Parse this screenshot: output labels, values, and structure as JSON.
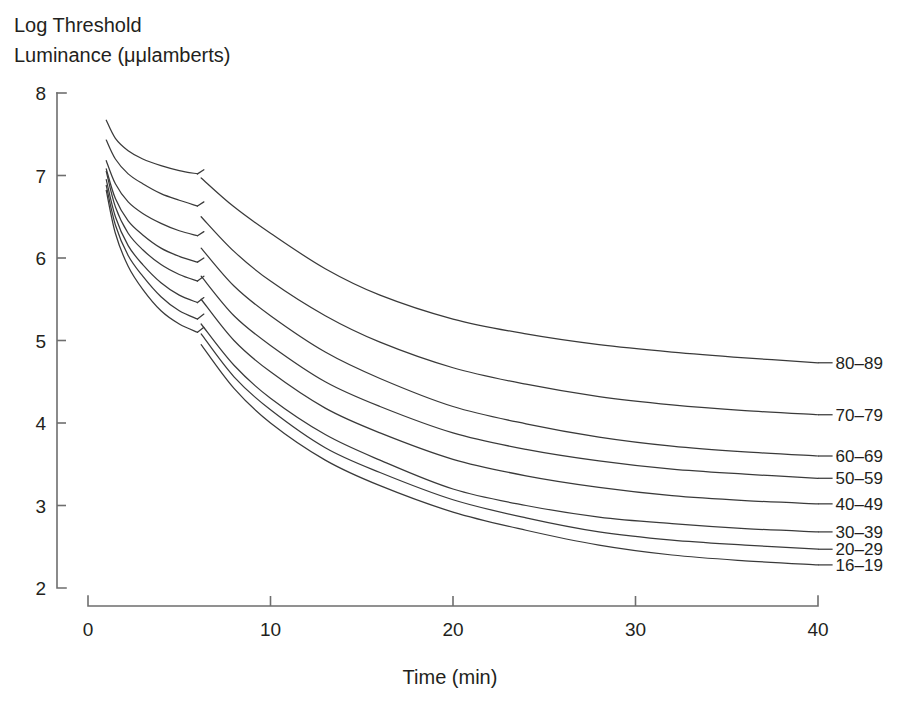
{
  "chart_data": {
    "type": "line",
    "title": "",
    "subtitle": "",
    "xlabel": "Time (min)",
    "ylabel_lines": [
      "Log Threshold",
      "Luminance (μμlamberts)"
    ],
    "ylabel": "Log Threshold Luminance (μμlamberts)",
    "xlim": [
      0,
      40
    ],
    "ylim": [
      2,
      8
    ],
    "xticks": [
      0,
      10,
      20,
      30,
      40
    ],
    "xtick_labels": [
      "0",
      "10",
      "20",
      "30",
      "40"
    ],
    "yticks": [
      2,
      3,
      4,
      5,
      6,
      7,
      8
    ],
    "ytick_labels": [
      "2",
      "3",
      "4",
      "5",
      "6",
      "7",
      "8"
    ],
    "grid": false,
    "legend_position": "right-inline-labels",
    "line_color": "#3a3a3a",
    "axis_color": "#6e6e6e",
    "background_color": "#ffffff",
    "note": "Dark adaptation curves by age group; each curve has an early cone branch (1-6 min) and a later rod branch (6-40 min) separated by the rod-cone break.",
    "series": [
      {
        "name": "80-89",
        "label": "80–89",
        "label_x": 40.8,
        "label_y": 4.73,
        "cone": {
          "x": [
            1.0,
            1.5,
            2.2,
            3.0,
            4.0,
            5.0,
            6.0
          ],
          "y": [
            7.67,
            7.45,
            7.3,
            7.2,
            7.12,
            7.06,
            7.02
          ]
        },
        "break_tick": {
          "x": [
            6.0,
            6.35
          ],
          "y": [
            7.02,
            7.07
          ]
        },
        "rod": {
          "x": [
            6.2,
            8,
            10,
            13,
            16,
            20,
            24,
            28,
            32,
            36,
            40
          ],
          "y": [
            6.97,
            6.62,
            6.3,
            5.87,
            5.55,
            5.26,
            5.08,
            4.95,
            4.86,
            4.79,
            4.73
          ]
        }
      },
      {
        "name": "70-79",
        "label": "70–79",
        "label_x": 40.8,
        "label_y": 4.1,
        "cone": {
          "x": [
            1.0,
            1.5,
            2.2,
            3.0,
            4.0,
            5.0,
            6.0
          ],
          "y": [
            7.43,
            7.2,
            7.02,
            6.9,
            6.78,
            6.7,
            6.63
          ]
        },
        "break_tick": {
          "x": [
            6.0,
            6.35
          ],
          "y": [
            6.63,
            6.68
          ]
        },
        "rod": {
          "x": [
            6.2,
            8,
            10,
            13,
            16,
            20,
            24,
            28,
            32,
            36,
            40
          ],
          "y": [
            6.5,
            6.08,
            5.72,
            5.3,
            4.98,
            4.67,
            4.47,
            4.32,
            4.22,
            4.15,
            4.1
          ]
        }
      },
      {
        "name": "60-69",
        "label": "60–69",
        "label_x": 40.8,
        "label_y": 3.6,
        "cone": {
          "x": [
            1.0,
            1.5,
            2.2,
            3.0,
            4.0,
            5.0,
            6.0
          ],
          "y": [
            7.18,
            6.9,
            6.68,
            6.54,
            6.42,
            6.33,
            6.27
          ]
        },
        "break_tick": {
          "x": [
            6.0,
            6.35
          ],
          "y": [
            6.27,
            6.32
          ]
        },
        "rod": {
          "x": [
            6.2,
            8,
            10,
            13,
            16,
            20,
            24,
            28,
            32,
            36,
            40
          ],
          "y": [
            6.12,
            5.66,
            5.3,
            4.86,
            4.54,
            4.2,
            3.99,
            3.83,
            3.72,
            3.65,
            3.6
          ]
        }
      },
      {
        "name": "50-59",
        "label": "50–59",
        "label_x": 40.8,
        "label_y": 3.33,
        "cone": {
          "x": [
            1.0,
            1.5,
            2.2,
            3.0,
            4.0,
            5.0,
            6.0
          ],
          "y": [
            7.08,
            6.72,
            6.45,
            6.28,
            6.12,
            6.02,
            5.95
          ]
        },
        "break_tick": {
          "x": [
            6.0,
            6.35
          ],
          "y": [
            5.95,
            6.0
          ]
        },
        "rod": {
          "x": [
            6.2,
            8,
            10,
            13,
            16,
            20,
            24,
            28,
            32,
            36,
            40
          ],
          "y": [
            5.78,
            5.3,
            4.94,
            4.5,
            4.2,
            3.88,
            3.68,
            3.54,
            3.44,
            3.38,
            3.33
          ]
        }
      },
      {
        "name": "40-49",
        "label": "40–49",
        "label_x": 40.8,
        "label_y": 3.02,
        "cone": {
          "x": [
            1.0,
            1.5,
            2.2,
            3.0,
            4.0,
            5.0,
            6.0
          ],
          "y": [
            7.05,
            6.62,
            6.3,
            6.1,
            5.92,
            5.8,
            5.72
          ]
        },
        "break_tick": {
          "x": [
            6.0,
            6.35
          ],
          "y": [
            5.72,
            5.78
          ]
        },
        "rod": {
          "x": [
            6.2,
            8,
            10,
            13,
            16,
            20,
            24,
            28,
            32,
            36,
            40
          ],
          "y": [
            5.5,
            5.0,
            4.62,
            4.18,
            3.88,
            3.56,
            3.36,
            3.22,
            3.12,
            3.06,
            3.02
          ]
        }
      },
      {
        "name": "30-39",
        "label": "30–39",
        "label_x": 40.8,
        "label_y": 2.68,
        "cone": {
          "x": [
            1.0,
            1.5,
            2.2,
            3.0,
            4.0,
            5.0,
            6.0
          ],
          "y": [
            6.95,
            6.5,
            6.15,
            5.92,
            5.7,
            5.55,
            5.46
          ]
        },
        "break_tick": {
          "x": [
            6.0,
            6.35
          ],
          "y": [
            5.46,
            5.52
          ]
        },
        "rod": {
          "x": [
            6.2,
            8,
            10,
            13,
            16,
            20,
            24,
            28,
            32,
            36,
            40
          ],
          "y": [
            5.2,
            4.7,
            4.3,
            3.86,
            3.55,
            3.2,
            3.0,
            2.86,
            2.78,
            2.72,
            2.68
          ]
        }
      },
      {
        "name": "20-29",
        "label": "20–29",
        "label_x": 40.8,
        "label_y": 2.47,
        "cone": {
          "x": [
            1.0,
            1.5,
            2.2,
            3.0,
            4.0,
            5.0,
            6.0
          ],
          "y": [
            6.88,
            6.4,
            6.03,
            5.78,
            5.53,
            5.36,
            5.26
          ]
        },
        "break_tick": {
          "x": [
            6.0,
            6.35
          ],
          "y": [
            5.26,
            5.32
          ]
        },
        "rod": {
          "x": [
            6.2,
            8,
            10,
            13,
            16,
            20,
            24,
            28,
            32,
            36,
            40
          ],
          "y": [
            5.08,
            4.56,
            4.16,
            3.7,
            3.4,
            3.07,
            2.85,
            2.68,
            2.58,
            2.52,
            2.47
          ]
        }
      },
      {
        "name": "16-19",
        "label": "16–19",
        "label_x": 40.8,
        "label_y": 2.28,
        "cone": {
          "x": [
            1.0,
            1.5,
            2.2,
            3.0,
            4.0,
            5.0,
            6.0
          ],
          "y": [
            6.82,
            6.3,
            5.9,
            5.62,
            5.36,
            5.2,
            5.1
          ]
        },
        "break_tick": {
          "x": [
            6.0,
            6.35
          ],
          "y": [
            5.1,
            5.16
          ]
        },
        "rod": {
          "x": [
            6.2,
            8,
            10,
            13,
            16,
            20,
            24,
            28,
            32,
            36,
            40
          ],
          "y": [
            4.95,
            4.42,
            4.0,
            3.55,
            3.24,
            2.92,
            2.7,
            2.52,
            2.4,
            2.33,
            2.28
          ]
        }
      }
    ]
  }
}
